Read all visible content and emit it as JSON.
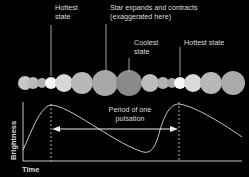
{
  "labels": {
    "hottest_left": [
      "Hottest",
      "state"
    ],
    "expands": [
      "Star expands and contracts",
      "(exaggerated here)"
    ],
    "coolest": [
      "Coolest",
      "state"
    ],
    "hottest_right": "Hottest state",
    "period": [
      "Period of one",
      "pulsation"
    ],
    "y_axis": "Brightness",
    "x_axis": "Time"
  },
  "colors": {
    "background": "#000000",
    "text": "#dddddd",
    "hottest_star": "#f4f4f4",
    "coolest_star": "#8a8a8a"
  },
  "stars": [
    {
      "cx": 25,
      "r": 7,
      "fill": "#c8c8c8"
    },
    {
      "cx": 33,
      "r": 6,
      "fill": "#bcbcbc"
    },
    {
      "cx": 42,
      "r": 5,
      "fill": "#b0b0b0"
    },
    {
      "cx": 51,
      "r": 6,
      "fill": "#f5f5f5"
    },
    {
      "cx": 64,
      "r": 9,
      "fill": "#d8d8d8"
    },
    {
      "cx": 82,
      "r": 11,
      "fill": "#b8b8b8"
    },
    {
      "cx": 105,
      "r": 13,
      "fill": "#a8a8a8"
    },
    {
      "cx": 129,
      "r": 13,
      "fill": "#8a8a8a"
    },
    {
      "cx": 150,
      "r": 9,
      "fill": "#bcbcbc"
    },
    {
      "cx": 163,
      "r": 6,
      "fill": "#b4b4b4"
    },
    {
      "cx": 172,
      "r": 5,
      "fill": "#a8a8a8"
    },
    {
      "cx": 180,
      "r": 6,
      "fill": "#f5f5f5"
    },
    {
      "cx": 193,
      "r": 9,
      "fill": "#dadada"
    },
    {
      "cx": 211,
      "r": 11,
      "fill": "#b8b8b8"
    },
    {
      "cx": 233,
      "r": 12,
      "fill": "#aaaaaa"
    }
  ]
}
